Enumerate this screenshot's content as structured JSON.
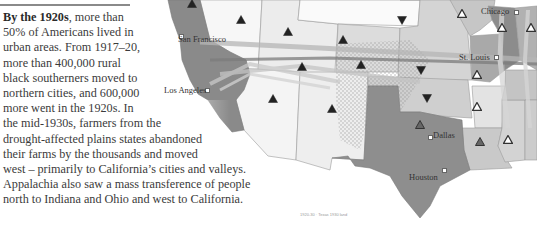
{
  "text_block": {
    "lead": "By the 1920s",
    "lines": [
      ", more than",
      "50% of Americans lived in",
      "urban areas. From 1917–20,",
      "more than 400,000 rural",
      "black southerners moved to",
      "northern cities, and 600,000",
      "more went in the 1920s. In",
      "the mid-1930s, farmers from the",
      "drought-affected plains states abandoned",
      "their farms by the thousands and moved",
      "west – primarily to California’s cities and valleys.",
      "Appalachia also saw a mass transference of people",
      "north to Indiana and Ohio and west to California."
    ]
  },
  "map": {
    "cities": [
      {
        "name": "San Francisco",
        "x": 180,
        "y": 35
      },
      {
        "name": "Los Angeles",
        "x": 206,
        "y": 89
      },
      {
        "name": "Chicago",
        "x": 515,
        "y": 11
      },
      {
        "name": "St. Louis",
        "x": 495,
        "y": 56
      },
      {
        "name": "Dallas",
        "x": 429,
        "y": 136
      },
      {
        "name": "Houston",
        "x": 443,
        "y": 169
      }
    ],
    "markers": [
      {
        "type": "up-filled",
        "x": 192,
        "y": 3
      },
      {
        "type": "up-filled",
        "x": 241,
        "y": 19
      },
      {
        "type": "up-filled",
        "x": 288,
        "y": 31
      },
      {
        "type": "up-filled",
        "x": 343,
        "y": 39
      },
      {
        "type": "up-filled",
        "x": 273,
        "y": 98
      },
      {
        "type": "up-filled",
        "x": 332,
        "y": 108
      },
      {
        "type": "up-filled",
        "x": 302,
        "y": 66
      },
      {
        "type": "up-filled",
        "x": 361,
        "y": 64
      },
      {
        "type": "down-filled",
        "x": 402,
        "y": 20
      },
      {
        "type": "down-filled",
        "x": 421,
        "y": 70
      },
      {
        "type": "down-filled",
        "x": 427,
        "y": 98
      },
      {
        "type": "up-outline",
        "x": 462,
        "y": 13
      },
      {
        "type": "up-outline",
        "x": 502,
        "y": 27
      },
      {
        "type": "up-outline",
        "x": 531,
        "y": 27
      },
      {
        "type": "up-outline",
        "x": 477,
        "y": 74
      },
      {
        "type": "up-outline",
        "x": 477,
        "y": 106
      },
      {
        "type": "up-outline",
        "x": 508,
        "y": 139
      },
      {
        "type": "up-gray",
        "x": 420,
        "y": 124
      },
      {
        "type": "up-gray",
        "x": 480,
        "y": 141
      }
    ]
  },
  "caption": "1920-30 · Texas 1930 land"
}
